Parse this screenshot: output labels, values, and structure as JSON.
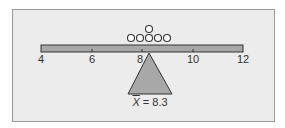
{
  "diagram": {
    "title": "",
    "type": "balance-beam-mean",
    "axis": {
      "min": 4,
      "max": 12,
      "ticks": [
        4,
        6,
        8,
        10,
        12
      ],
      "tick_labels": [
        "4",
        "6",
        "8",
        "10",
        "12"
      ]
    },
    "data_points": [
      7.5,
      8,
      8,
      8.5,
      9,
      9
    ],
    "dots": [
      {
        "x": 7.5,
        "stack": 0
      },
      {
        "x": 7.9,
        "stack": 0
      },
      {
        "x": 8.3,
        "stack": 0
      },
      {
        "x": 8.3,
        "stack": 1
      },
      {
        "x": 8.7,
        "stack": 0
      },
      {
        "x": 9.1,
        "stack": 0
      }
    ],
    "fulcrum_value": 8.3,
    "mean_label": {
      "symbol": "X",
      "text": " = 8.3"
    },
    "colors": {
      "panel_bg": "#ececec",
      "panel_border": "#9a9a9a",
      "beam_fill": "#a8a8a8",
      "fulcrum_fill": "#a8a8a8",
      "stroke": "#333333",
      "dot_fill": "#ffffff"
    }
  }
}
